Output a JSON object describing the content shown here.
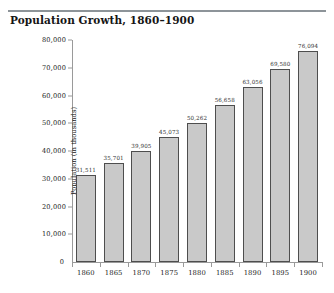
{
  "chart_data": {
    "type": "bar",
    "title": "Population Growth, 1860–1900",
    "xlabel": "",
    "ylabel": "Population (in thousands)",
    "categories": [
      "1860",
      "1865",
      "1870",
      "1875",
      "1880",
      "1885",
      "1890",
      "1895",
      "1900"
    ],
    "values": [
      31511,
      35701,
      39905,
      45073,
      50262,
      56658,
      63056,
      69580,
      76094
    ],
    "value_labels": [
      "31,511",
      "35,701",
      "39,905",
      "45,073",
      "50,262",
      "56,658",
      "63,056",
      "69,580",
      "76,094"
    ],
    "ylim": [
      0,
      80000
    ],
    "yticks": [
      0,
      10000,
      20000,
      30000,
      40000,
      50000,
      60000,
      70000,
      80000
    ],
    "ytick_labels": [
      "0",
      "10,000",
      "20,000",
      "30,000",
      "40,000",
      "50,000",
      "60,000",
      "70,000",
      "80,000"
    ],
    "grid": false,
    "legend": null,
    "bar_color": "#c9c9c9",
    "bar_border_color": "#4e4e4e",
    "axis_color": "#9a9a9a",
    "rule_color": "#8d9499"
  }
}
